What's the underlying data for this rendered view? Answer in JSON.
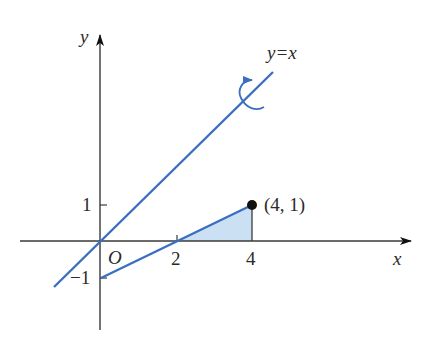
{
  "diagram": {
    "axes": {
      "x_label": "x",
      "y_label": "y",
      "origin_label": "O",
      "x_ticks": [
        "2",
        "4"
      ],
      "y_ticks": [
        "1",
        "−1"
      ]
    },
    "lines": [
      {
        "name": "y=x",
        "label": "y=x",
        "color": "#3a6fbf",
        "description": "axis of rotation"
      },
      {
        "name": "y=(x-2)/2",
        "from": [
          0,
          -1
        ],
        "to": [
          4,
          1
        ],
        "color": "#3a6fbf"
      }
    ],
    "point": {
      "label": "(4, 1)",
      "x": 4,
      "y": 1
    },
    "shaded_region": {
      "vertices": [
        [
          2,
          0
        ],
        [
          4,
          1
        ],
        [
          4,
          0
        ]
      ],
      "fill": "#c9def3"
    },
    "rotation_arrow_icon": "curved-rotation-arrow",
    "colors": {
      "line": "#3a6fbf",
      "axis": "#3a3a3a",
      "fill": "#c9def3",
      "point": "#111111"
    }
  }
}
